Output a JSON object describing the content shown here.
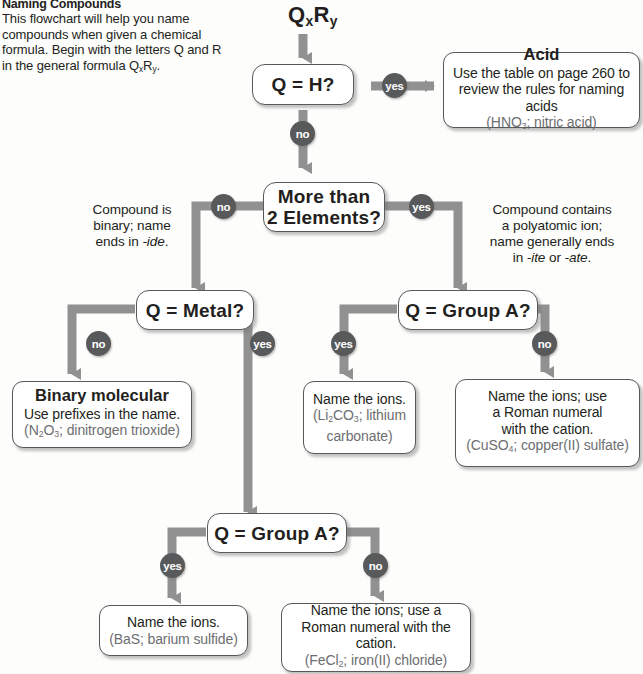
{
  "intro": {
    "title": "Naming Compounds",
    "body": "This flowchart will help you name compounds when given a chemical formula. Begin with the letters Q and R in the general formula QxRy."
  },
  "start": {
    "label": "QxRy",
    "q": "Q",
    "x": "x",
    "r": "R",
    "y": "y"
  },
  "nodes": {
    "q_is_h": {
      "text": "Q = H?"
    },
    "acid": {
      "head": "Acid",
      "line1": "Use the table on page 260 to",
      "line2": "review the rules for naming acids",
      "example": "(HNO3; nitric acid)",
      "ex_pre": "(HNO",
      "ex_sub": "3",
      "ex_post": "; nitric acid)"
    },
    "more_than_two": {
      "line1": "More than",
      "line2": "2 Elements?"
    },
    "q_metal": {
      "text": "Q = Metal?"
    },
    "q_group_a_right": {
      "text": "Q = Group A?"
    },
    "q_group_a_bottom": {
      "text": "Q = Group A?"
    },
    "binary_molecular": {
      "head": "Binary molecular",
      "line1": "Use prefixes in the name.",
      "ex_pre": "(N",
      "ex_sub1": "2",
      "ex_mid": "O",
      "ex_sub2": "3",
      "ex_post": "; dinitrogen trioxide)"
    },
    "name_ions_li": {
      "line1": "Name the ions.",
      "ex_pre": "(Li",
      "ex_sub1": "2",
      "ex_mid": "CO",
      "ex_sub2": "3",
      "ex_post": "; lithium",
      "ex_line2": "carbonate)"
    },
    "name_ions_cu": {
      "line1": "Name the ions; use",
      "line2": "a Roman numeral",
      "line3": "with the cation.",
      "ex_pre": "(CuSO",
      "ex_sub": "4",
      "ex_post": "; copper(II) sulfate)"
    },
    "name_ions_bas": {
      "line1": "Name the ions.",
      "example": "(BaS; barium sulfide)"
    },
    "name_ions_fe": {
      "line1": "Name the ions; use a",
      "line2": "Roman numeral with the cation.",
      "ex_pre": "(FeCl",
      "ex_sub": "2",
      "ex_post": "; iron(II) chloride)"
    }
  },
  "annotations": {
    "left_binary": {
      "line1": "Compound is",
      "line2": "binary; name",
      "line3_pre": "ends in ",
      "line3_em": "-ide",
      "line3_post": "."
    },
    "right_polyatomic": {
      "line1": "Compound contains",
      "line2": "a polyatomic ion;",
      "line3": "name generally ends",
      "line4_pre": "in ",
      "line4_em1": "-ite",
      "line4_mid": " or ",
      "line4_em2": "-ate",
      "line4_post": "."
    }
  },
  "badges": {
    "yes": "yes",
    "no": "no",
    "acid_yes": "yes",
    "q_is_h_no": "no",
    "more_no": "no",
    "more_yes": "yes",
    "metal_no": "no",
    "metal_yes": "yes",
    "groupa_right_yes": "yes",
    "groupa_right_no": "no",
    "groupa_bottom_yes": "yes",
    "groupa_bottom_no": "no"
  },
  "colors": {
    "connector": "#919191",
    "badge": "#58595b",
    "box_border": "#58595b",
    "text": "#231f20",
    "example_text": "#6d6e71",
    "background": "#fdfdfc"
  }
}
